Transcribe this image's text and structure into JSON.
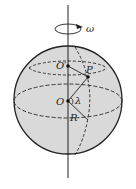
{
  "diagram": {
    "type": "rotating-sphere-latitude",
    "labels": {
      "omega": "ω",
      "center_upper": "O′",
      "point": "P",
      "center": "O",
      "angle": "λ",
      "radius": "R"
    },
    "colors": {
      "sphere_fill": "#d9d9d9",
      "line": "#222222",
      "background": "#ffffff"
    }
  }
}
